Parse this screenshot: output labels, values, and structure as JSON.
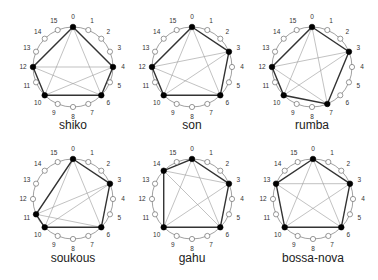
{
  "figure": {
    "pulses": 16,
    "radius": 40,
    "label_radius": 50,
    "colors": {
      "onset_fill": "#000000",
      "empty_fill": "#ffffff",
      "circle_stroke": "#888888",
      "polygon_stroke": "#333333",
      "chord_stroke": "#999999",
      "label": "#222222"
    },
    "rhythms": [
      {
        "name": "shiko",
        "cx": 73,
        "cy": 67,
        "label_y": 129,
        "onsets": [
          0,
          4,
          6,
          10,
          12
        ]
      },
      {
        "name": "son",
        "cx": 192,
        "cy": 67,
        "label_y": 129,
        "onsets": [
          0,
          3,
          6,
          10,
          12
        ]
      },
      {
        "name": "rumba",
        "cx": 312,
        "cy": 67,
        "label_y": 129,
        "onsets": [
          0,
          3,
          7,
          10,
          12
        ]
      },
      {
        "name": "soukous",
        "cx": 73,
        "cy": 199,
        "label_y": 262,
        "onsets": [
          0,
          3,
          6,
          10,
          11
        ]
      },
      {
        "name": "gahu",
        "cx": 192,
        "cy": 199,
        "label_y": 262,
        "onsets": [
          0,
          3,
          6,
          10,
          14
        ]
      },
      {
        "name": "bossa-nova",
        "cx": 313,
        "cy": 199,
        "label_y": 262,
        "onsets": [
          0,
          3,
          6,
          10,
          13
        ]
      }
    ]
  }
}
